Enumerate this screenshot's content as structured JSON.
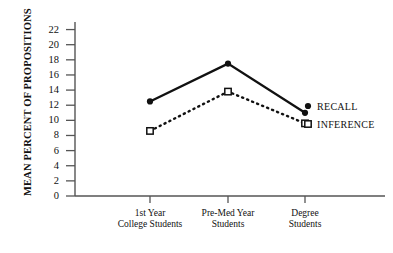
{
  "chart_data": {
    "type": "line",
    "title": "",
    "subtitle": "",
    "xlabel": "",
    "ylabel": "MEAN PERCENT OF PROPOSITIONS",
    "categories": [
      "1st Year\nCollege Students",
      "Pre-Med Year\nStudents",
      "Degree\nStudents"
    ],
    "series": [
      {
        "name": "RECALL",
        "values": [
          12.5,
          17.5,
          11.0
        ],
        "marker": "filled-circle",
        "linestyle": "solid"
      },
      {
        "name": "INFERENCE",
        "values": [
          8.6,
          13.8,
          9.6
        ],
        "marker": "open-square",
        "linestyle": "dotted"
      }
    ],
    "ylim": [
      0,
      23
    ],
    "yticks": [
      0,
      2,
      4,
      6,
      8,
      10,
      12,
      14,
      16,
      18,
      20,
      22
    ],
    "ytick_labels": [
      "0",
      "2",
      "4",
      "6",
      "8",
      "10",
      "12",
      "14",
      "16",
      "18",
      "20",
      "22"
    ],
    "grid": false,
    "legend_position": "right-inline",
    "colors": {
      "line": "#111111",
      "axis": "#555555",
      "background": "#ffffff"
    }
  },
  "legend": {
    "recall_label": "RECALL",
    "inference_label": "INFERENCE"
  },
  "axes": {
    "y_title": "MEAN PERCENT OF PROPOSITIONS"
  }
}
